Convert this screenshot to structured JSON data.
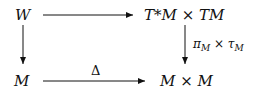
{
  "diagram": {
    "type": "commutative-diagram",
    "nodes": {
      "top_left": "W",
      "top_right_a": "T*M",
      "times1": "×",
      "top_right_b": "TM",
      "bottom_left": "M",
      "bottom_right_a": "M",
      "times2": "×",
      "bottom_right_b": "M"
    },
    "labels": {
      "right_arrow_pi": "π",
      "right_arrow_pi_sub": "M",
      "right_arrow_times": "×",
      "right_arrow_tau": "τ",
      "right_arrow_tau_sub": "M",
      "bottom_arrow": "Δ"
    },
    "edges": [
      {
        "from": "W",
        "to": "T*M × TM",
        "label": ""
      },
      {
        "from": "W",
        "to": "M",
        "label": ""
      },
      {
        "from": "T*M × TM",
        "to": "M × M",
        "label": "π_M × τ_M"
      },
      {
        "from": "M",
        "to": "M × M",
        "label": "Δ"
      }
    ]
  }
}
